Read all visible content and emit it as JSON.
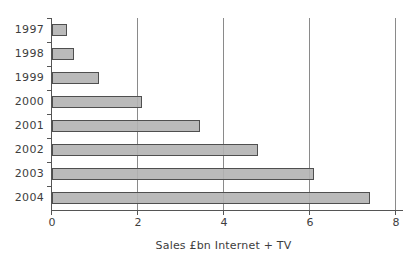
{
  "chart_data": {
    "type": "bar",
    "orientation": "horizontal",
    "title": "",
    "xlabel": "Sales £bn Internet + TV",
    "ylabel": "",
    "categories": [
      "1997",
      "1998",
      "1999",
      "2000",
      "2001",
      "2002",
      "2003",
      "2004"
    ],
    "values": [
      0.35,
      0.5,
      1.1,
      2.1,
      3.45,
      4.8,
      6.1,
      7.4
    ],
    "xlim": [
      0,
      8
    ],
    "xticks": [
      0,
      2,
      4,
      6,
      8
    ],
    "grid": "vertical gridlines at x ticks, drawn full plot height",
    "legend": "none"
  },
  "colors": {
    "background": "#ffffff",
    "bar_fill": "#b2b2b2",
    "bar_border": "#4f4f4f",
    "axis_line": "#555555",
    "gridline": "#8a8a8a",
    "text": "#3d3d3d"
  }
}
